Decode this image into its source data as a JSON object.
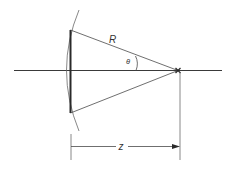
{
  "diagram": {
    "labels": {
      "radius": "R",
      "angle": "θ",
      "distance": "z"
    },
    "colors": {
      "stroke": "#3a3a3a",
      "light_stroke": "#6a6a6a",
      "background": "#ffffff"
    }
  }
}
